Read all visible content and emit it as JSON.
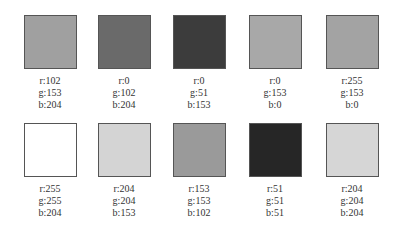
{
  "swatches": [
    {
      "r": "r:102",
      "g": "g:153",
      "b": "b:204",
      "rgb": [
        102,
        153,
        204
      ],
      "display_gray": "#a0a0a0"
    },
    {
      "r": "r:0",
      "g": "g:102",
      "b": "b:204",
      "rgb": [
        0,
        102,
        204
      ],
      "display_gray": "#6a6a6a"
    },
    {
      "r": "r:0",
      "g": "g:51",
      "b": "b:153",
      "rgb": [
        0,
        51,
        153
      ],
      "display_gray": "#3c3c3c"
    },
    {
      "r": "r:0",
      "g": "g:153",
      "b": "b:0",
      "rgb": [
        0,
        153,
        0
      ],
      "display_gray": "#a8a8a8"
    },
    {
      "r": "r:255",
      "g": "g:153",
      "b": "b:0",
      "rgb": [
        255,
        153,
        0
      ],
      "display_gray": "#a3a3a3"
    },
    {
      "r": "r:255",
      "g": "g:255",
      "b": "b:204",
      "rgb": [
        255,
        255,
        204
      ],
      "display_gray": "#ffffff"
    },
    {
      "r": "r:204",
      "g": "g:204",
      "b": "b:153",
      "rgb": [
        204,
        204,
        153
      ],
      "display_gray": "#d4d4d4"
    },
    {
      "r": "r:153",
      "g": "g:153",
      "b": "b:102",
      "rgb": [
        153,
        153,
        102
      ],
      "display_gray": "#9a9a9a"
    },
    {
      "r": "r:51",
      "g": "g:51",
      "b": "b:51",
      "rgb": [
        51,
        51,
        51
      ],
      "display_gray": "#262626"
    },
    {
      "r": "r:204",
      "g": "g:204",
      "b": "b:204",
      "rgb": [
        204,
        204,
        204
      ],
      "display_gray": "#d6d6d6"
    }
  ]
}
